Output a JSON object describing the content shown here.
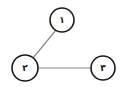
{
  "diagram": {
    "type": "graph",
    "nodes": [
      {
        "id": "1",
        "label": "١",
        "cx": 62,
        "cy": 20,
        "r": 12
      },
      {
        "id": "2",
        "label": "٢",
        "cx": 25,
        "cy": 68,
        "r": 13
      },
      {
        "id": "3",
        "label": "٣",
        "cx": 103,
        "cy": 68,
        "r": 12
      }
    ],
    "edges": [
      {
        "from": "1",
        "to": "2"
      },
      {
        "from": "2",
        "to": "3"
      }
    ],
    "colors": {
      "edge": "#8a8a8a",
      "node_stroke": "#1a1a1a",
      "node_fill": "#ffffff",
      "background": "#ffffff"
    }
  }
}
